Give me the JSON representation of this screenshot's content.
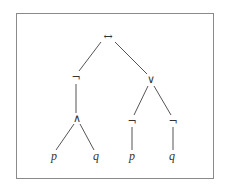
{
  "diagram": {
    "type": "syntax-tree",
    "border_color": "#8a8a8a",
    "edge_color": "#555555",
    "nodes": [
      {
        "id": "root",
        "label": "↔",
        "x": 108,
        "y": 37,
        "kind": "operator",
        "name": "biconditional"
      },
      {
        "id": "negL",
        "label": "¬",
        "x": 76,
        "y": 78,
        "kind": "operator",
        "name": "negation"
      },
      {
        "id": "or",
        "label": "∨",
        "x": 151,
        "y": 80,
        "kind": "operator",
        "name": "disjunction"
      },
      {
        "id": "and",
        "label": "∧",
        "x": 77,
        "y": 119,
        "kind": "operator",
        "name": "conjunction"
      },
      {
        "id": "negP",
        "label": "¬",
        "x": 132,
        "y": 122,
        "kind": "operator",
        "name": "negation"
      },
      {
        "id": "negQ",
        "label": "¬",
        "x": 173,
        "y": 122,
        "kind": "operator",
        "name": "negation"
      },
      {
        "id": "p1",
        "label": "p",
        "x": 54,
        "y": 157,
        "kind": "leaf",
        "name": "variable-p"
      },
      {
        "id": "q1",
        "label": "q",
        "x": 96,
        "y": 157,
        "kind": "leaf",
        "name": "variable-q"
      },
      {
        "id": "p2",
        "label": "p",
        "x": 132,
        "y": 157,
        "kind": "leaf",
        "name": "variable-p"
      },
      {
        "id": "q2",
        "label": "q",
        "x": 172,
        "y": 157,
        "kind": "leaf",
        "name": "variable-q"
      }
    ],
    "edges": [
      {
        "from": "root",
        "to": "negL",
        "x1": 101,
        "y1": 42,
        "x2": 79,
        "y2": 71
      },
      {
        "from": "root",
        "to": "or",
        "x1": 115,
        "y1": 42,
        "x2": 147,
        "y2": 74
      },
      {
        "from": "negL",
        "to": "and",
        "x1": 76,
        "y1": 84,
        "x2": 76,
        "y2": 113
      },
      {
        "from": "or",
        "to": "negP",
        "x1": 148,
        "y1": 86,
        "x2": 134,
        "y2": 115
      },
      {
        "from": "or",
        "to": "negQ",
        "x1": 154,
        "y1": 86,
        "x2": 171,
        "y2": 115
      },
      {
        "from": "and",
        "to": "p1",
        "x1": 74,
        "y1": 124,
        "x2": 56,
        "y2": 150
      },
      {
        "from": "and",
        "to": "q1",
        "x1": 80,
        "y1": 124,
        "x2": 94,
        "y2": 150
      },
      {
        "from": "negP",
        "to": "p2",
        "x1": 132,
        "y1": 127,
        "x2": 132,
        "y2": 150
      },
      {
        "from": "negQ",
        "to": "q2",
        "x1": 173,
        "y1": 127,
        "x2": 173,
        "y2": 150
      }
    ]
  }
}
